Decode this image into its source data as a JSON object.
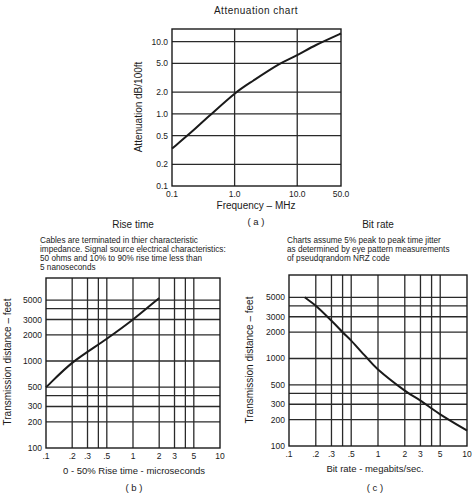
{
  "chart_data": [
    {
      "id": "a",
      "type": "line",
      "title": "Attenuation chart",
      "caption": "( a )",
      "xlabel": "Frequency – MHz",
      "ylabel": "Attenuation dB/100ft",
      "xscale": "log",
      "yscale": "log",
      "xlim": [
        0.1,
        50.0
      ],
      "ylim": [
        0.1,
        15.0
      ],
      "xticks": [
        0.1,
        1.0,
        10.0,
        50.0
      ],
      "xtick_labels": [
        "0.1",
        "1.0",
        "10.0",
        "50.0"
      ],
      "yticks": [
        0.1,
        0.2,
        0.5,
        1.0,
        2.0,
        5.0,
        10.0
      ],
      "ytick_labels": [
        "0.1",
        "0.2",
        "0.5",
        "1.0",
        "2.0",
        "5.0",
        "10.0"
      ],
      "grid": true,
      "frame": {
        "x0": 172,
        "x1": 341,
        "y0": 186,
        "y1": 29
      },
      "series": [
        {
          "name": "Attenuation",
          "x": [
            0.1,
            0.2,
            0.4,
            1.0,
            2.0,
            5.0,
            10.0,
            20.0,
            50.0
          ],
          "y": [
            0.33,
            0.55,
            0.95,
            1.9,
            2.9,
            4.8,
            6.5,
            9.0,
            13.0
          ]
        }
      ]
    },
    {
      "id": "b",
      "type": "line",
      "title": "Rise time",
      "caption": "( b )",
      "note": [
        "Cables are terminated in thier characteristic",
        "impedance. Signal source electrical characteristics:",
        "50 ohms and 10% to 90% rise time less than",
        "5 nanoseconds"
      ],
      "xlabel": "0 - 50%  Rise time - microseconds",
      "ylabel": "Transmission distance – feet",
      "xscale": "log",
      "yscale": "log",
      "xlim": [
        0.1,
        10
      ],
      "ylim": [
        100,
        9000
      ],
      "xticks": [
        0.1,
        0.2,
        0.3,
        0.4,
        0.5,
        1,
        2,
        3,
        4,
        5,
        10
      ],
      "xtick_labels": [
        ".1",
        ".2",
        ".3",
        "",
        ".5",
        "1",
        "2",
        "3",
        "",
        "5",
        "10"
      ],
      "yticks": [
        100,
        200,
        300,
        400,
        500,
        1000,
        2000,
        3000,
        4000,
        5000
      ],
      "ytick_labels": [
        "100",
        "200",
        "300",
        "",
        "500",
        "1000",
        "2000",
        "3000",
        "",
        "5000"
      ],
      "grid": true,
      "frame": {
        "x0": 46,
        "x1": 220,
        "y0": 448,
        "y1": 278
      },
      "series": [
        {
          "name": "Transmission distance",
          "x": [
            0.1,
            0.2,
            0.5,
            1,
            2
          ],
          "y": [
            500,
            950,
            1800,
            3000,
            5300
          ]
        }
      ]
    },
    {
      "id": "c",
      "type": "line",
      "title": "Bit rate",
      "caption": "( c )",
      "note": [
        "Charts assume 5% peak to peak time jitter",
        "as determined by eye pattern measurements",
        "of pseudqrandom NRZ code"
      ],
      "xlabel": "Bit  rate - megabits/sec.",
      "ylabel": "Transmission distance – feet",
      "xscale": "log",
      "yscale": "log",
      "xlim": [
        0.1,
        10
      ],
      "ylim": [
        100,
        9000
      ],
      "xticks": [
        0.1,
        0.2,
        0.3,
        0.4,
        0.5,
        1,
        2,
        3,
        4,
        5,
        10
      ],
      "xtick_labels": [
        ".1",
        ".2",
        ".3",
        "",
        ".5",
        "1",
        "2",
        "3",
        "",
        "5",
        "10"
      ],
      "yticks": [
        100,
        200,
        300,
        400,
        500,
        1000,
        2000,
        3000,
        4000,
        5000
      ],
      "ytick_labels": [
        "100",
        "200",
        "300",
        "",
        "500",
        "1000",
        "2000",
        "3000",
        "",
        "5000"
      ],
      "grid": true,
      "frame": {
        "x0": 289,
        "x1": 467,
        "y0": 446,
        "y1": 275
      },
      "series": [
        {
          "name": "Transmission distance",
          "x": [
            0.15,
            0.2,
            0.3,
            0.4,
            0.5,
            0.7,
            1,
            2,
            3,
            5,
            10
          ],
          "y": [
            5000,
            4000,
            2700,
            2000,
            1600,
            1100,
            750,
            430,
            330,
            230,
            150
          ]
        }
      ]
    }
  ],
  "colors": {
    "ink": "#1a1a1a",
    "grid": "#2a2a2a",
    "background": "#ffffff"
  }
}
